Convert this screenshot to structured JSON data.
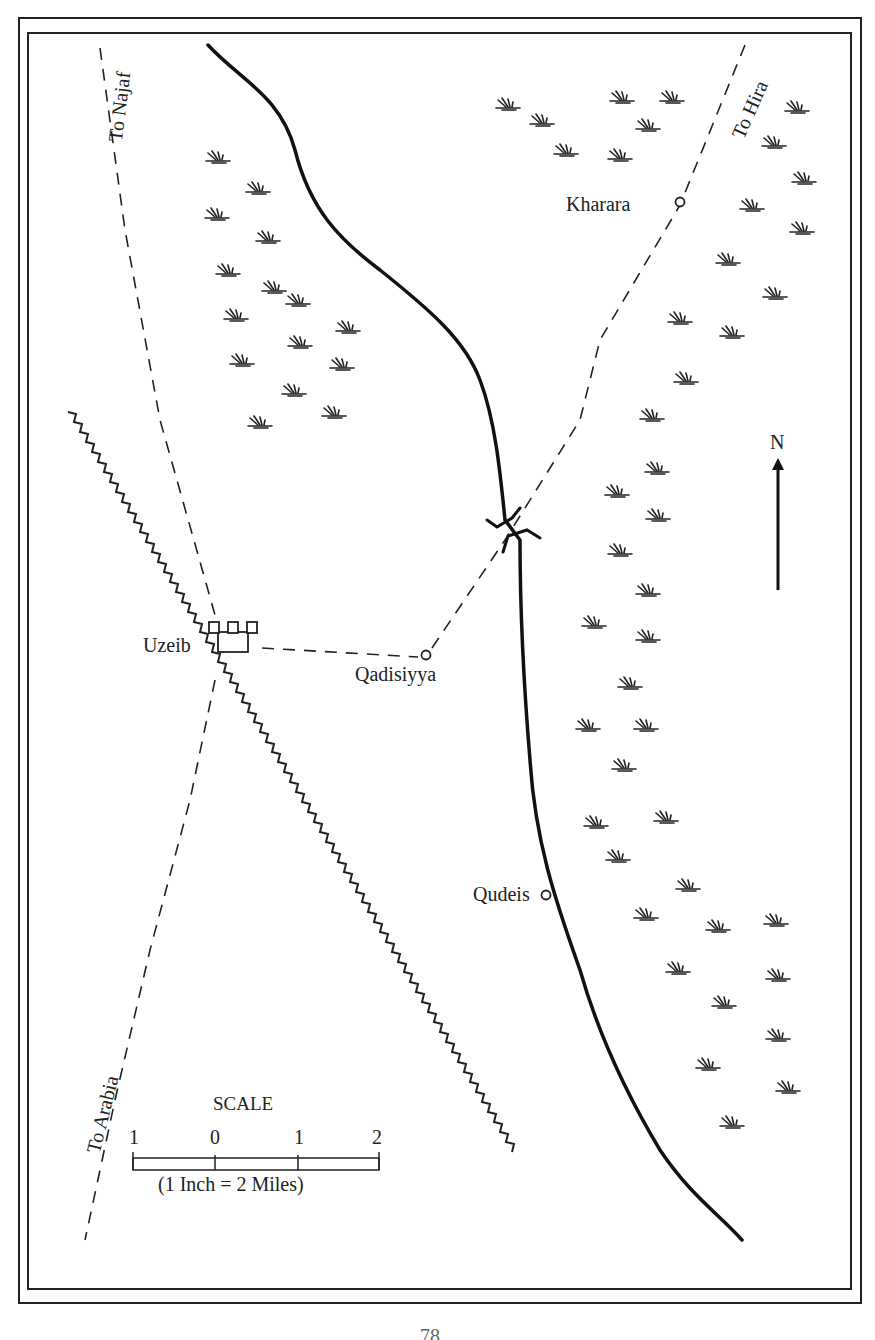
{
  "map": {
    "places": {
      "kharara": "Kharara",
      "uzeib": "Uzeib",
      "qadisiyya": "Qadisiyya",
      "qudeis": "Qudeis"
    },
    "roads": {
      "to_najaf": "To Najaf",
      "to_hira": "To Hira",
      "to_arabia": "To Arabia"
    },
    "north_label": "N",
    "scale": {
      "title": "SCALE",
      "ticks": [
        "1",
        "0",
        "1",
        "2"
      ],
      "note": "(1 Inch = 2 Miles)"
    }
  },
  "page": {
    "number": "78"
  }
}
